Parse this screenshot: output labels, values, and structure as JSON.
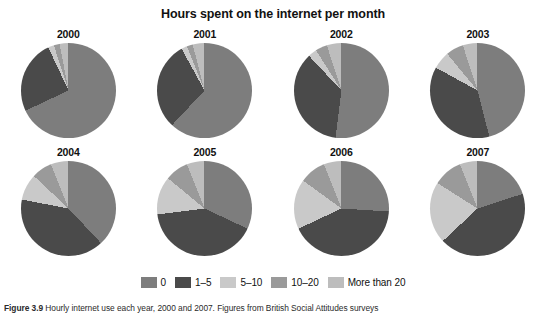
{
  "chart_data": {
    "type": "pie",
    "title": "Hours spent on the internet per month",
    "xlabel": "",
    "ylabel": "",
    "legend_position": "bottom",
    "categories": [
      "0",
      "1–5",
      "5–10",
      "10–20",
      "More than 20"
    ],
    "colors": [
      "#7d7d7d",
      "#4a4a4a",
      "#c9c9c9",
      "#9a9a9a",
      "#bdbdbd"
    ],
    "panels": [
      {
        "label": "2000",
        "values": [
          68,
          25,
          2,
          2,
          3
        ]
      },
      {
        "label": "2001",
        "values": [
          62,
          30,
          2,
          2,
          4
        ]
      },
      {
        "label": "2002",
        "values": [
          52,
          36,
          3,
          4,
          5
        ]
      },
      {
        "label": "2003",
        "values": [
          46,
          37,
          6,
          6,
          5
        ]
      },
      {
        "label": "2004",
        "values": [
          38,
          40,
          9,
          7,
          6
        ]
      },
      {
        "label": "2005",
        "values": [
          32,
          41,
          13,
          8,
          6
        ]
      },
      {
        "label": "2006",
        "values": [
          26,
          42,
          17,
          9,
          6
        ]
      },
      {
        "label": "2007",
        "values": [
          20,
          43,
          21,
          10,
          6
        ]
      }
    ]
  },
  "legend": {
    "items": [
      {
        "label": "0",
        "color": "#7d7d7d"
      },
      {
        "label": "1–5",
        "color": "#4a4a4a"
      },
      {
        "label": "5–10",
        "color": "#c9c9c9"
      },
      {
        "label": "10–20",
        "color": "#9a9a9a"
      },
      {
        "label": "More than 20",
        "color": "#bdbdbd"
      }
    ]
  },
  "caption": {
    "prefix": "Figure 3.9",
    "text": "Hourly internet use each year, 2000 and 2007. Figures from British Social Attitudes surveys"
  }
}
